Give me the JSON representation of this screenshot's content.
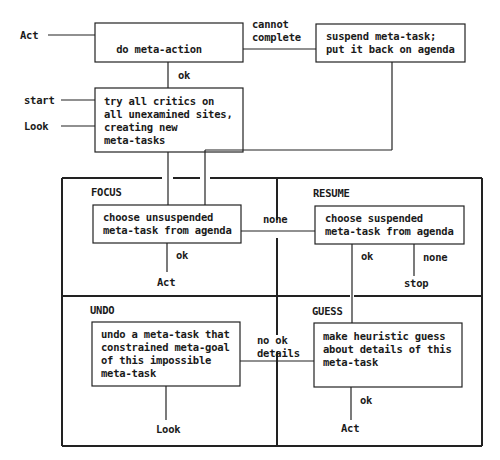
{
  "title_fragment": "",
  "boxes": {
    "do_meta_action": {
      "lines": [
        "do meta-action"
      ]
    },
    "suspend": {
      "lines": [
        "suspend meta-task;",
        "put it back on agenda"
      ]
    },
    "try_critics": {
      "lines": [
        "try all critics on",
        "all unexamined sites,",
        "creating new",
        "meta-tasks"
      ]
    },
    "focus": {
      "lines": [
        "choose unsuspended",
        "meta-task from agenda"
      ]
    },
    "resume": {
      "lines": [
        "choose suspended",
        "meta-task from agenda"
      ]
    },
    "undo": {
      "lines": [
        "undo a meta-task that",
        "constrained meta-goal",
        "of this impossible",
        "meta-task"
      ]
    },
    "guess": {
      "lines": [
        "make heuristic guess",
        "about details of this",
        "meta-task"
      ]
    }
  },
  "regions": {
    "focus": "FOCUS",
    "resume": "RESUME",
    "undo": "UNDO",
    "guess": "GUESS"
  },
  "entry_labels": {
    "act": "Act",
    "start": "start",
    "look": "Look"
  },
  "edge_labels": {
    "cannot_complete": [
      "cannot",
      "complete"
    ],
    "ok_top": "ok",
    "none_focus_resume": "none",
    "ok_focus": "ok",
    "act_focus": "Act",
    "ok_resume": "ok",
    "none_resume": "none",
    "stop": "stop",
    "no_ok_details": [
      "no ok",
      "details"
    ],
    "look_undo": "Look",
    "ok_guess": "ok",
    "act_guess": "Act"
  }
}
